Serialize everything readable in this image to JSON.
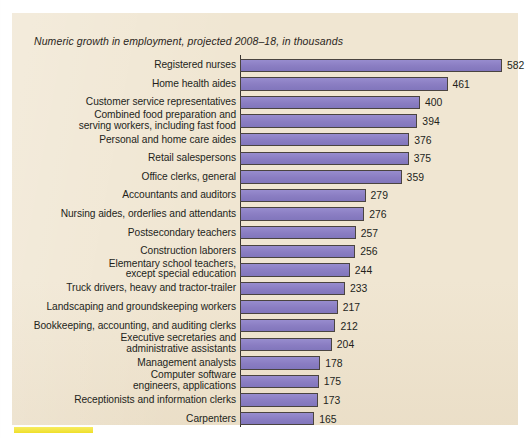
{
  "chart_data": {
    "type": "bar",
    "orientation": "horizontal",
    "title": "Numeric growth in employment, projected 2008–18, in thousands",
    "xlabel": "",
    "ylabel": "",
    "units": "thousands",
    "xlim": [
      0,
      582
    ],
    "grid": false,
    "legend": null,
    "bar_color": "#8f83c8",
    "panel_color": "#f0e6d2",
    "categories": [
      "Registered nurses",
      "Home health aides",
      "Customer service representatives",
      "Combined food preparation and\nserving workers, including fast food",
      "Personal and home care aides",
      "Retail salespersons",
      "Office clerks, general",
      "Accountants and auditors",
      "Nursing aides, orderlies and attendants",
      "Postsecondary teachers",
      "Construction laborers",
      "Elementary school teachers,\nexcept special education",
      "Truck drivers, heavy and tractor-trailer",
      "Landscaping and groundskeeping workers",
      "Bookkeeping, accounting, and auditing clerks",
      "Executive secretaries and\nadministrative assistants",
      "Management analysts",
      "Computer software\nengineers, applications",
      "Receptionists and information clerks",
      "Carpenters"
    ],
    "values": [
      582,
      461,
      400,
      394,
      376,
      375,
      359,
      279,
      276,
      257,
      256,
      244,
      233,
      217,
      212,
      204,
      178,
      175,
      173,
      165
    ],
    "value_labels": [
      "582",
      "461",
      "400",
      "394",
      "376",
      "375",
      "359",
      "279",
      "276",
      "257",
      "256",
      "244",
      "233",
      "217",
      "212",
      "204",
      "178",
      "175",
      "173",
      "165"
    ]
  },
  "decorations": {
    "highlight_swatch_color": "#f2e33c"
  }
}
